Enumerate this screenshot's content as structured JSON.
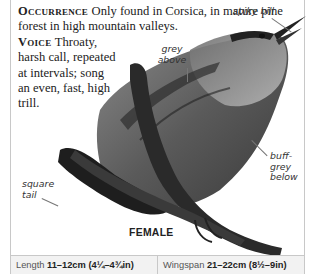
{
  "species_text": {
    "occurrence": {
      "heading": "Occurrence",
      "body": "Only found in Corsica, in mature pine forest in high mountain valleys."
    },
    "voice": {
      "heading": "Voice",
      "body": "Throaty, harsh call, repeated at intervals; song an even, fast, high trill."
    }
  },
  "illustration": {
    "caption": "FEMALE",
    "annotations": [
      {
        "id": "spiky-bill",
        "text": "spiky bill"
      },
      {
        "id": "grey-above",
        "text": "grey above"
      },
      {
        "id": "buff-grey-below",
        "text": "buff-grey below"
      },
      {
        "id": "square-tail",
        "text": "square tail"
      }
    ]
  },
  "measurements": {
    "length": {
      "label": "Length",
      "value": "11–12cm (4¼–4¾in)"
    },
    "wingspan": {
      "label": "Wingspan",
      "value": "21–22cm (8½–9in)"
    }
  }
}
